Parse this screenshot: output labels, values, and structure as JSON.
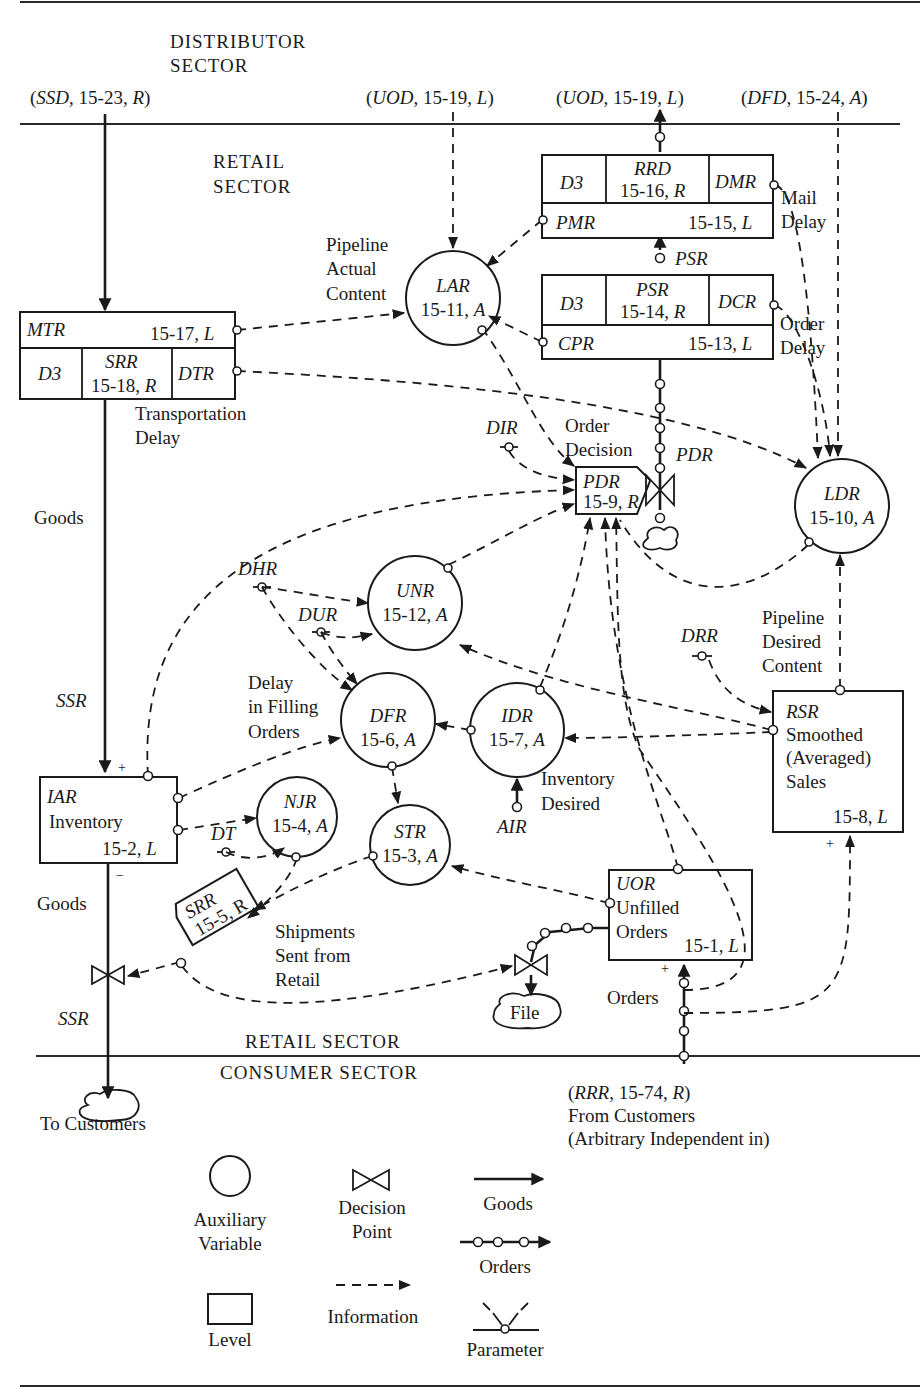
{
  "sectors": {
    "distributor": [
      "DISTRIBUTOR",
      "SECTOR"
    ],
    "retail_top": [
      "RETAIL",
      "SECTOR"
    ],
    "retail_bottom": "RETAIL SECTOR",
    "consumer": "CONSUMER SECTOR"
  },
  "external_refs": {
    "ssd": {
      "var": "SSD",
      "eq": "15-23",
      "type": "R"
    },
    "uod_in": {
      "var": "UOD",
      "eq": "15-19",
      "type": "L"
    },
    "uod_out": {
      "var": "UOD",
      "eq": "15-19",
      "type": "L"
    },
    "dfd": {
      "var": "DFD",
      "eq": "15-24",
      "type": "A"
    },
    "rrr": {
      "var": "RRR",
      "eq": "15-74",
      "type": "R"
    },
    "rrr_caption": [
      "From Customers",
      "(Arbitrary Independent in)"
    ]
  },
  "levels": {
    "mtr": {
      "name": "MTR",
      "eq": "15-17,",
      "type": "L"
    },
    "pmr": {
      "name": "PMR",
      "eq": "15-15,",
      "type": "L"
    },
    "cpr": {
      "name": "CPR",
      "eq": "15-13,",
      "type": "L"
    },
    "iar": {
      "name": "IAR",
      "label": "Inventory",
      "eq": "15-2,",
      "type": "L"
    },
    "rsr": {
      "name": "RSR",
      "label": [
        "Smoothed",
        "(Averaged)",
        "Sales"
      ],
      "eq": "15-8,",
      "type": "L"
    },
    "uor": {
      "name": "UOR",
      "label": [
        "Unfilled",
        "Orders"
      ],
      "eq": "15-1,",
      "type": "L"
    }
  },
  "delays": {
    "srr_delay": {
      "d": "D3",
      "name": "SRR",
      "eq": "15-18,",
      "type": "R",
      "param": "DTR",
      "caption": [
        "Transportation",
        "Delay"
      ]
    },
    "rrd_delay": {
      "d": "D3",
      "name": "RRD",
      "eq": "15-16,",
      "type": "R",
      "param": "DMR",
      "caption": [
        "Mail",
        "Delay"
      ]
    },
    "psr_delay": {
      "d": "D3",
      "name": "PSR",
      "eq": "15-14,",
      "type": "R",
      "param": "DCR",
      "caption": [
        "Order",
        "Delay"
      ]
    }
  },
  "rates": {
    "pdr": {
      "name": "PDR",
      "eq": "15-9,",
      "type": "R",
      "caption": [
        "Order",
        "Decision"
      ],
      "flow_label": "PDR"
    },
    "srr": {
      "name": "SRR",
      "eq": "15-5,",
      "type": "R",
      "caption": [
        "Shipments",
        "Sent from",
        "Retail"
      ]
    }
  },
  "auxiliaries": {
    "lar": {
      "name": "LAR",
      "eq": "15-11,",
      "type": "A",
      "caption": [
        "Pipeline",
        "Actual",
        "Content"
      ]
    },
    "ldr": {
      "name": "LDR",
      "eq": "15-10,",
      "type": "A",
      "caption": [
        "Pipeline",
        "Desired",
        "Content"
      ]
    },
    "unr": {
      "name": "UNR",
      "eq": "15-12,",
      "type": "A"
    },
    "dfr": {
      "name": "DFR",
      "eq": "15-6,",
      "type": "A",
      "caption": [
        "Delay",
        "in Filling",
        "Orders"
      ]
    },
    "idr": {
      "name": "IDR",
      "eq": "15-7,",
      "type": "A",
      "caption": [
        "Inventory",
        "Desired"
      ]
    },
    "njr": {
      "name": "NJR",
      "eq": "15-4,",
      "type": "A"
    },
    "str": {
      "name": "STR",
      "eq": "15-3,",
      "type": "A"
    }
  },
  "parameters": {
    "dir": "DIR",
    "dhr": "DHR",
    "dur": "DUR",
    "drr": "DRR",
    "dt": "DT",
    "air": "AIR"
  },
  "flow_labels": {
    "goods_upper": "Goods",
    "ssr_upper": "SSR",
    "goods_lower": "Goods",
    "ssr_lower": "SSR",
    "psr": "PSR",
    "orders": "Orders",
    "file": "File",
    "to_customers": "To Customers",
    "plus": "+",
    "minus": "−"
  },
  "legend": {
    "auxiliary": [
      "Auxiliary",
      "Variable"
    ],
    "decision": [
      "Decision",
      "Point"
    ],
    "goods": "Goods",
    "orders": "Orders",
    "level": "Level",
    "information": "Information",
    "parameter": "Parameter"
  }
}
